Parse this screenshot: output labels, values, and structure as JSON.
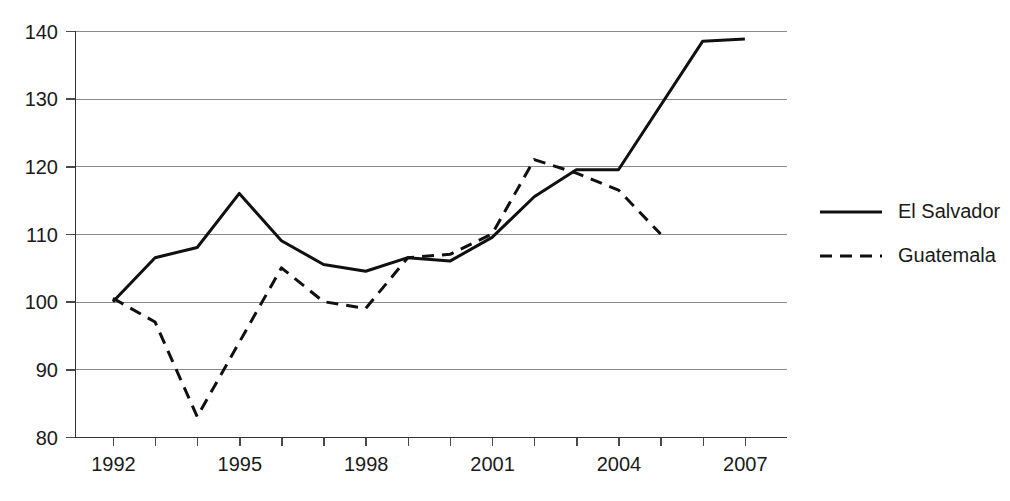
{
  "chart_data": {
    "type": "line",
    "title": "",
    "subtitle": "",
    "xlabel": "",
    "ylabel": "",
    "xlim": [
      1991.1,
      2008.0
    ],
    "ylim": [
      80,
      140
    ],
    "grid": true,
    "grid_axis": "y",
    "legend_position": "right",
    "x_tick_values": [
      1992,
      1993,
      1994,
      1995,
      1996,
      1997,
      1998,
      1999,
      2000,
      2001,
      2002,
      2003,
      2004,
      2005,
      2006,
      2007
    ],
    "x_tick_labels": [
      "1992",
      "",
      "",
      "1995",
      "",
      "",
      "1998",
      "",
      "",
      "2001",
      "",
      "",
      "2004",
      "",
      "",
      "2007"
    ],
    "y_tick_values": [
      80,
      90,
      100,
      110,
      120,
      130,
      140
    ],
    "y_tick_labels": [
      "80",
      "90",
      "100",
      "110",
      "120",
      "130",
      "140"
    ],
    "series": [
      {
        "name": "El Salvador",
        "style": "solid",
        "color": "#101010",
        "x": [
          1992,
          1993,
          1994,
          1995,
          1996,
          1997,
          1998,
          1999,
          2000,
          2001,
          2002,
          2003,
          2004,
          2006,
          2007
        ],
        "values": [
          100.0,
          106.5,
          108.0,
          116.0,
          109.0,
          105.5,
          104.5,
          106.5,
          106.0,
          109.5,
          115.5,
          119.5,
          119.5,
          138.5,
          138.8
        ]
      },
      {
        "name": "Guatemala",
        "style": "dashed",
        "color": "#101010",
        "x": [
          1992,
          1993,
          1994,
          1996,
          1997,
          1998,
          1999,
          2000,
          2001,
          2002,
          2003,
          2004,
          2005
        ],
        "values": [
          100.5,
          97.0,
          83.0,
          105.0,
          100.0,
          99.0,
          106.5,
          107.0,
          110.0,
          121.0,
          119.0,
          116.5,
          110.0
        ]
      }
    ]
  },
  "legend": {
    "entries": [
      {
        "label": "El Salvador",
        "style": "solid"
      },
      {
        "label": "Guatemala",
        "style": "dashed"
      }
    ]
  },
  "colors": {
    "line": "#101010",
    "grid": "#8a8a8a",
    "axis": "#333333",
    "text": "#1a1a1a",
    "background": "#ffffff"
  }
}
